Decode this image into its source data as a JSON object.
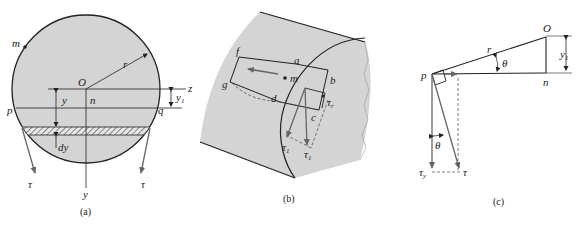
{
  "figure_a": {
    "caption": "(a)",
    "labels": {
      "m": "m",
      "O": "O",
      "r": "r",
      "z": "z",
      "y1": "y",
      "y1_sub": "1",
      "y": "y",
      "n": "n",
      "p": "p",
      "q": "q",
      "dy": "dy",
      "tau_left": "τ",
      "tau_right": "τ",
      "y_axis": "y"
    }
  },
  "figure_b": {
    "caption": "(b)",
    "labels": {
      "f": "f",
      "g": "g",
      "a": "a",
      "m": "m",
      "b": "b",
      "d": "d",
      "c": "c",
      "tau_r": "τ",
      "tau_r_sub": "r",
      "tau_1": "τ",
      "tau_1_sub": "1",
      "tau_1b": "τ",
      "tau_1b_sub": "1"
    }
  },
  "figure_c": {
    "caption": "(c)",
    "labels": {
      "O": "O",
      "r": "r",
      "theta_top": "θ",
      "y1": "y",
      "y1_sub": "1",
      "p": "p",
      "n": "n",
      "theta_bottom": "θ",
      "tau_y": "τ",
      "tau_y_sub": "y",
      "tau": "τ"
    }
  },
  "colors": {
    "fill": "#d4d4d4",
    "line": "#222222",
    "arrow": "#666666"
  }
}
